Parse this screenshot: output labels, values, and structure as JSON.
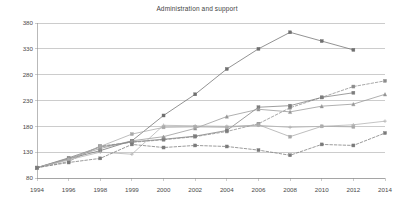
{
  "chart": {
    "title": "Administration and support",
    "type": "line"
  },
  "chart_data": {
    "type": "line",
    "title": "Administration and support",
    "xlabel": "",
    "ylabel": "",
    "categories": [
      "1994",
      "1996",
      "1998",
      "1999",
      "2000",
      "2002",
      "2004",
      "2006",
      "2008",
      "2010",
      "2012",
      "2014"
    ],
    "ylim": [
      80,
      380
    ],
    "yticks": [
      80,
      130,
      180,
      230,
      280,
      330,
      380
    ],
    "grid": true,
    "legend": "none",
    "series": [
      {
        "name": "series-1",
        "color": "#6f6f6f",
        "dash": "solid",
        "marker": "square",
        "values": [
          100,
          117,
          133,
          152,
          201,
          242,
          291,
          330,
          362,
          345,
          328,
          null
        ]
      },
      {
        "name": "series-2",
        "color": "#8c8c8c",
        "dash": "dashed",
        "marker": "square",
        "values": [
          100,
          112,
          142,
          149,
          154,
          160,
          170,
          185,
          216,
          236,
          257,
          268
        ]
      },
      {
        "name": "series-3",
        "color": "#7d7d7d",
        "dash": "solid",
        "marker": "square",
        "values": [
          100,
          119,
          140,
          150,
          155,
          161,
          172,
          217,
          220,
          236,
          245,
          null
        ]
      },
      {
        "name": "series-4",
        "color": "#959595",
        "dash": "solid",
        "marker": "triangle",
        "values": [
          100,
          118,
          137,
          152,
          160,
          176,
          199,
          213,
          208,
          219,
          223,
          242
        ]
      },
      {
        "name": "series-5",
        "color": "#a8a8a8",
        "dash": "solid",
        "marker": "square",
        "values": [
          100,
          116,
          141,
          165,
          178,
          179,
          178,
          183,
          160,
          180,
          179,
          null
        ]
      },
      {
        "name": "series-6",
        "color": "#b0b0b0",
        "dash": "solid",
        "marker": "plus",
        "values": [
          100,
          115,
          130,
          126,
          182,
          181,
          180,
          182,
          178,
          180,
          183,
          190
        ]
      },
      {
        "name": "series-7",
        "color": "#7a7a7a",
        "dash": "dashed",
        "marker": "square",
        "values": [
          100,
          110,
          118,
          145,
          139,
          143,
          141,
          134,
          124,
          145,
          143,
          167
        ]
      }
    ]
  }
}
